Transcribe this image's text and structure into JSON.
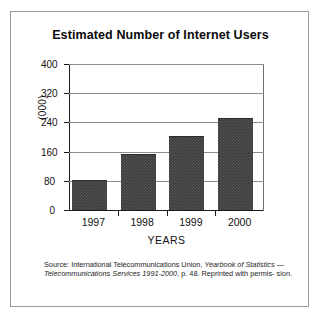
{
  "chart_data": {
    "type": "bar",
    "title": "Estimated Number of Internet Users",
    "xlabel": "YEARS",
    "ylabel": "(000)",
    "categories": [
      "1997",
      "1998",
      "1999",
      "2000"
    ],
    "values": [
      80,
      152,
      200,
      250
    ],
    "ylim": [
      0,
      400
    ],
    "yticks": [
      0,
      80,
      160,
      240,
      320,
      400
    ],
    "ytick_labels": [
      "0",
      "80",
      "160",
      "240",
      "320",
      "400"
    ],
    "grid": true,
    "legend": "none",
    "bar_color": "#3b3b3b",
    "frame_color": "#9a9a9a",
    "gridline_color": "#8d8d8d"
  },
  "source": {
    "line1_prefix": "Source: International Telecommunications Union, ",
    "line1_italic": "Yearbook of Statistics",
    "line2_italic": "— Telecommunications Services 1991-2000",
    "line2_suffix": ", p. 48. Reprinted with permis-",
    "line3": "sion."
  }
}
